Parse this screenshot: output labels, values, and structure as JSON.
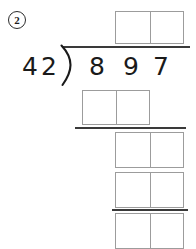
{
  "problem": {
    "number_label": "2",
    "number_shape": "circle"
  },
  "division": {
    "operation": "long-division",
    "divisor": "42",
    "divisor_digits": [
      "4",
      "2"
    ],
    "dividend": "897",
    "dividend_digits": [
      "8",
      "9",
      "7"
    ],
    "bracket_glyph": ")",
    "quotient": "",
    "quotient_cells": [
      "",
      ""
    ]
  },
  "work_area": {
    "quotient_box": {
      "label": "quotient-answer-box",
      "cells": [
        "",
        ""
      ]
    },
    "partial_product_1": {
      "label": "first-partial-product-box",
      "cells": [
        "",
        ""
      ]
    },
    "partial_product_2": {
      "label": "second-partial-product-box",
      "cells": [
        "",
        ""
      ]
    },
    "partial_product_3": {
      "label": "third-partial-product-box",
      "cells": [
        "",
        ""
      ]
    },
    "remainder_box": {
      "label": "remainder-answer-box",
      "cells": [
        "",
        ""
      ]
    }
  },
  "rules": {
    "vinculum": "division-bar",
    "separator_1": "subtraction-line-1",
    "separator_2": "subtraction-line-2"
  },
  "colors": {
    "ink": "#1a1a1a",
    "rule": "#3a3a3a",
    "box_border": "#9c9c9c",
    "page": "#ffffff"
  }
}
